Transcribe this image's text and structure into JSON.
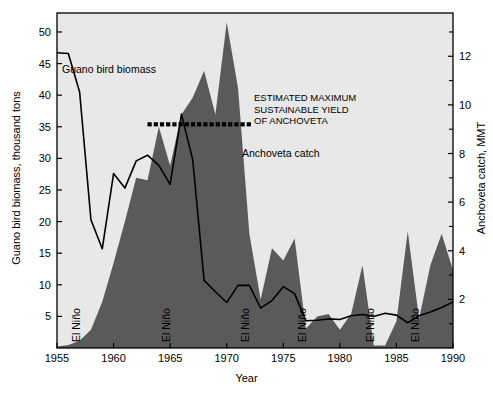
{
  "figure": {
    "background_color": "#ffffff",
    "plot_background_color": "#e8e8e8",
    "area_fill_color": "#5a5a5a",
    "line_color": "#000000",
    "frame_color": "#000000"
  },
  "axes": {
    "x": {
      "label": "Year",
      "ticks": [
        1955,
        1960,
        1965,
        1970,
        1975,
        1980,
        1985,
        1990
      ],
      "tick_labels": [
        "1955",
        "1960",
        "1965",
        "1970",
        "1975",
        "1980",
        "1985",
        "1990"
      ],
      "range": [
        1955,
        1990
      ]
    },
    "y_left": {
      "label": "Guano bird biomass, thousand tons",
      "ticks": [
        5,
        10,
        15,
        20,
        25,
        30,
        35,
        40,
        45,
        50
      ],
      "tick_labels": [
        "5",
        "10",
        "15",
        "20",
        "25",
        "30",
        "35",
        "40",
        "45",
        "50"
      ],
      "range": [
        0,
        53
      ]
    },
    "y_right": {
      "label": "Anchoveta catch, MMT",
      "ticks": [
        2,
        4,
        6,
        8,
        10,
        12
      ],
      "tick_labels": [
        "2",
        "4",
        "6",
        "8",
        "10",
        "12"
      ],
      "minor_ticks": [
        1,
        3,
        5,
        7,
        9,
        11,
        13
      ],
      "range": [
        0,
        13.78
      ]
    }
  },
  "annotations": {
    "guano_label": "Guano bird biomass",
    "anchoveta_label": "Anchoveta catch",
    "msy_label_line1": "ESTIMATED MAXIMUM",
    "msy_label_line2": "SUSTAINABLE YIELD",
    "msy_label_line3": "OF ANCHOVETA",
    "el_nino_label": "El Niño",
    "el_nino_years": [
      1957,
      1965,
      1972,
      1977,
      1983,
      1987
    ]
  },
  "chart_data": {
    "type": "area",
    "title": "",
    "xlabel": "Year",
    "ylabel": "Guano bird biomass, thousand tons",
    "ylabel_secondary": "Anchoveta catch, MMT",
    "xlim": [
      1955,
      1990
    ],
    "ylim_left": [
      0,
      53
    ],
    "ylim_right": [
      0,
      13.78
    ],
    "grid": false,
    "legend": "inline-annotations",
    "series": [
      {
        "name": "Anchoveta catch",
        "type": "area",
        "axis": "right",
        "units": "MMT",
        "color": "#5a5a5a",
        "x": [
          1955,
          1956,
          1957,
          1958,
          1959,
          1960,
          1961,
          1962,
          1963,
          1964,
          1965,
          1966,
          1967,
          1968,
          1969,
          1970,
          1971,
          1972,
          1973,
          1974,
          1975,
          1976,
          1977,
          1978,
          1979,
          1980,
          1981,
          1982,
          1983,
          1984,
          1985,
          1986,
          1987,
          1988,
          1989,
          1990
        ],
        "values": [
          0.06,
          0.12,
          0.3,
          0.75,
          1.9,
          3.5,
          5.2,
          7.0,
          6.9,
          9.1,
          7.5,
          9.6,
          10.3,
          11.4,
          9.6,
          13.4,
          10.7,
          4.7,
          2.0,
          4.1,
          3.6,
          4.5,
          0.8,
          1.3,
          1.4,
          0.75,
          1.4,
          3.4,
          0.1,
          0.1,
          1.1,
          4.8,
          1.2,
          3.4,
          4.7,
          3.2
        ]
      },
      {
        "name": "Guano bird biomass",
        "type": "line",
        "axis": "left",
        "units": "thousand tons",
        "color": "#000000",
        "x": [
          1955,
          1956,
          1957,
          1958,
          1959,
          1960,
          1961,
          1962,
          1963,
          1964,
          1965,
          1966,
          1967,
          1968,
          1969,
          1970,
          1971,
          1972,
          1973,
          1974,
          1975,
          1976,
          1977,
          1978,
          1979,
          1980,
          1981,
          1982,
          1983,
          1984,
          1985,
          1986,
          1987,
          1988,
          1989,
          1990
        ],
        "values": [
          46.7,
          46.6,
          40.5,
          20.3,
          15.7,
          27.6,
          25.3,
          29.6,
          30.5,
          28.9,
          25.9,
          37.0,
          29.7,
          10.7,
          8.9,
          7.2,
          9.9,
          9.9,
          6.3,
          7.5,
          9.7,
          8.6,
          4.3,
          4.4,
          4.6,
          4.5,
          5.1,
          5.3,
          5.0,
          5.5,
          5.2,
          4.0,
          5.1,
          5.7,
          6.4,
          7.3
        ]
      },
      {
        "name": "Estimated maximum sustainable yield of anchoveta",
        "type": "reference-line-dotted",
        "axis": "right",
        "units": "MMT",
        "value": 9.2,
        "x_start": 1963,
        "x_end": 1972,
        "color": "#000000"
      }
    ]
  }
}
